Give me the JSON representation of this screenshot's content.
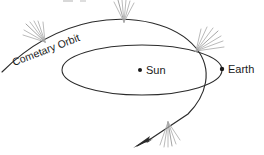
{
  "figure": {
    "type": "astronomy-diagram",
    "background_color": "#ffffff",
    "line_color": "#2b2b2b",
    "tail_color": "#a8a8a8",
    "labels": {
      "cometary_orbit": "Cometary Orbit",
      "sun": "Sun",
      "earth": "Earth"
    },
    "cut_off_top_text": "",
    "bodies": [
      {
        "name": "sun",
        "label": "Sun",
        "x": 140,
        "y": 70
      },
      {
        "name": "earth",
        "label": "Earth",
        "x": 222,
        "y": 69
      }
    ],
    "comet_tails": [
      {
        "name": "tail-upper-left",
        "x": 45,
        "y": 42
      },
      {
        "name": "tail-top",
        "x": 124,
        "y": 22
      },
      {
        "name": "tail-right",
        "x": 196,
        "y": 51
      },
      {
        "name": "tail-bottom",
        "x": 168,
        "y": 122
      }
    ],
    "arrow": {
      "name": "comet-direction-arrow",
      "x": 137,
      "y": 146
    }
  }
}
